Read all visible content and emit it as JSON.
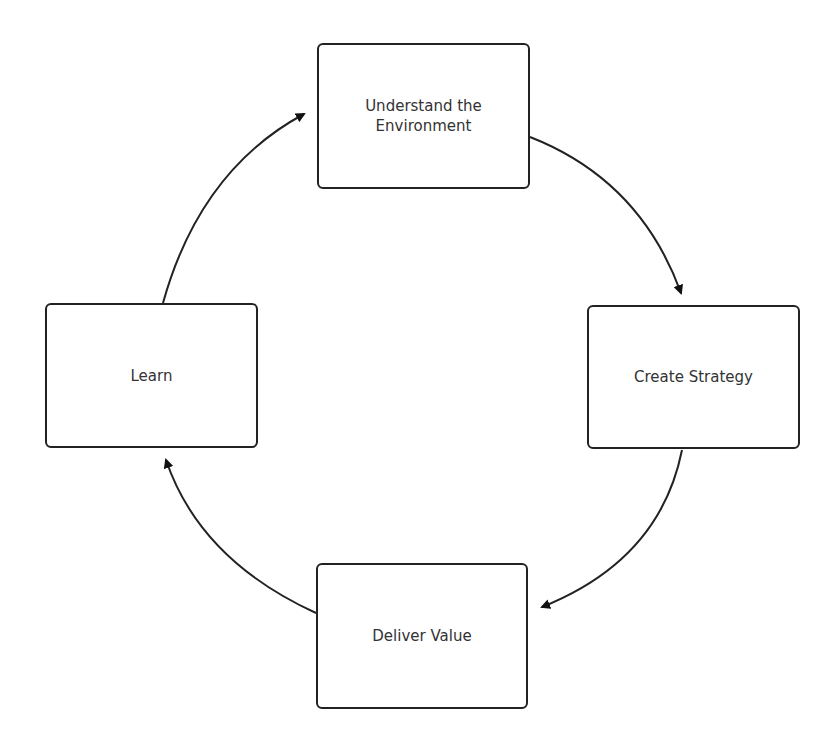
{
  "diagram": {
    "type": "cycle",
    "nodes": [
      {
        "id": "understand",
        "label": "Understand the Environment",
        "line1": "Understand the",
        "line2": "Environment"
      },
      {
        "id": "strategy",
        "label": "Create Strategy"
      },
      {
        "id": "deliver",
        "label": "Deliver Value"
      },
      {
        "id": "learn",
        "label": "Learn"
      }
    ],
    "edges": [
      {
        "from": "understand",
        "to": "strategy"
      },
      {
        "from": "strategy",
        "to": "deliver"
      },
      {
        "from": "deliver",
        "to": "learn"
      },
      {
        "from": "learn",
        "to": "understand"
      }
    ],
    "colors": {
      "stroke": "#222222",
      "text": "#333333",
      "background": "#ffffff"
    }
  }
}
